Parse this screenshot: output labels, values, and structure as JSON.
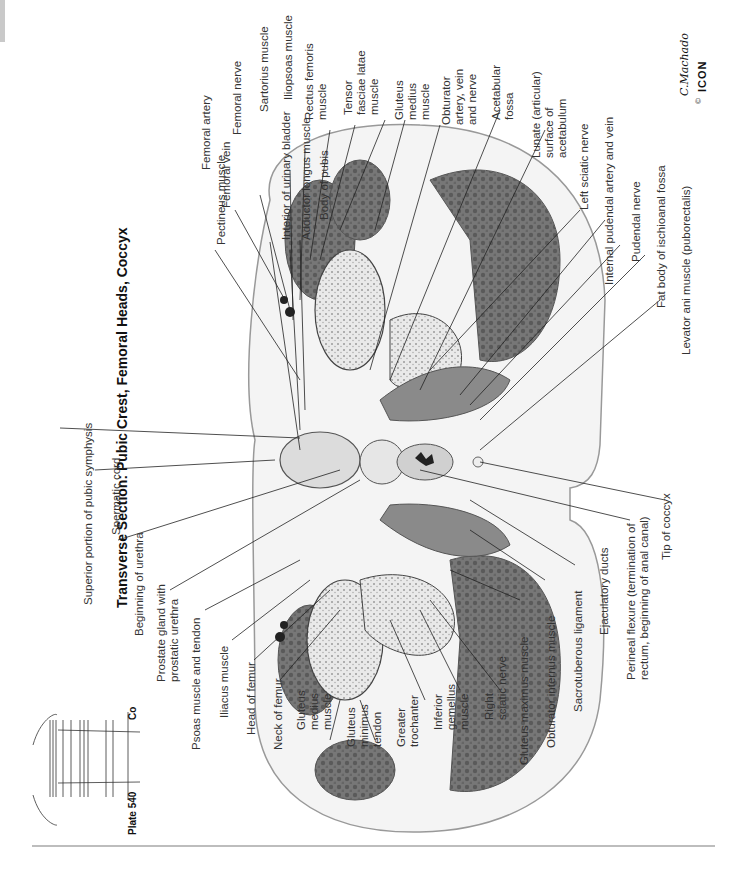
{
  "title": "Transverse Section: Pubic Crest, Femoral Heads, Coccyx",
  "plate": {
    "label": "Plate 540",
    "level_marker": "Co"
  },
  "signature": "C.Machado",
  "signature_sub": "M.D.",
  "publisher_logo": "ICON",
  "copyright_symbol": "©",
  "labels_top": [
    "Interior of urinary bladder",
    "Adductor longus muscle",
    "Body of pubis",
    "Pectineus muscle",
    "Femoral vein",
    "Femoral artery",
    "Femoral nerve",
    "Sartorius muscle",
    "Iliopsoas muscle",
    "Rectus femoris\nmuscle",
    "Tensor\nfasciae latae\nmuscle",
    "Gluteus\nmedius\nmuscle",
    "Obturator\nartery, vein\nand nerve",
    "Acetabular\nfossa",
    "Lunate (articular)\nsurface of\nacetabulum",
    "Left sciatic nerve",
    "Internal pudendal artery and vein",
    "Pudendal nerve",
    "Fat body of ischioanal fossa",
    "Levator ani muscle (puborectalis)"
  ],
  "labels_bottom": [
    "Superior portion of pubic symphysis",
    "Spermatic cord",
    "Beginning of urethra",
    "Prostate gland with\nprostatic urethra",
    "Psoas muscle and tendon",
    "Iliacus muscle",
    "Head of femur",
    "Neck of femur",
    "Gluteus\nmedius\nmuscle",
    "Gluteus\nminimus\ntendon",
    "Greater\ntrochanter",
    "Inferior\ngemellus\nmuscle",
    "Right\nsciatic nerve",
    "Gluteus maximus muscle",
    "Obturator internus muscle",
    "Sacrotuberous ligament",
    "Ejaculatory ducts",
    "Perineal flexure (termination of\nrectum, beginning of anal canal)",
    "Tip of coccyx"
  ],
  "colors": {
    "muscle": "#6e6e6e",
    "bone": "#e4e4e4",
    "fat": "#f2f2f2",
    "ink": "#222222"
  }
}
